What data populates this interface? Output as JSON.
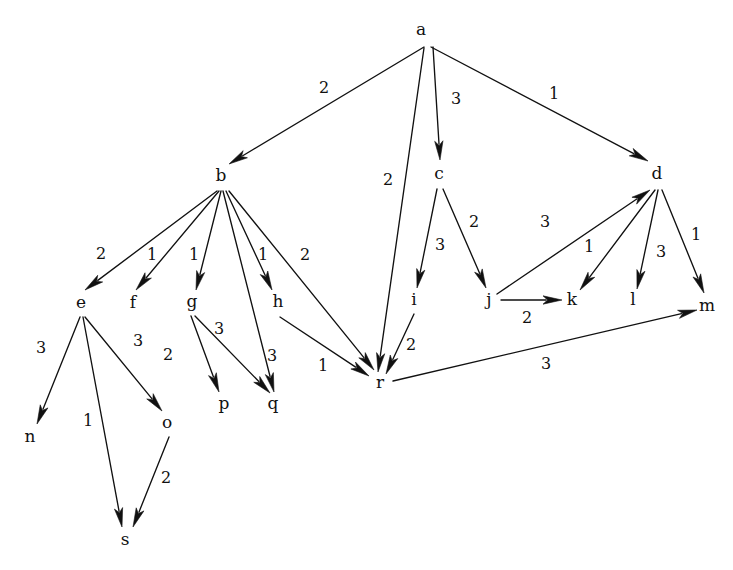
{
  "diagram": {
    "type": "directed-graph",
    "background_color": "#ffffff",
    "ink_color": "#111111",
    "width": 733,
    "height": 570,
    "nodes": [
      {
        "id": "a",
        "label": "a",
        "x": 421,
        "y": 30,
        "anchor_x": 425,
        "anchor_y": 47
      },
      {
        "id": "b",
        "label": "b",
        "x": 221,
        "y": 176,
        "anchor_x": 222,
        "anchor_y": 191
      },
      {
        "id": "c",
        "label": "c",
        "x": 439,
        "y": 174,
        "anchor_x": 440,
        "anchor_y": 189
      },
      {
        "id": "d",
        "label": "d",
        "x": 657,
        "y": 174,
        "anchor_x": 658,
        "anchor_y": 190
      },
      {
        "id": "e",
        "label": "e",
        "x": 81,
        "y": 303,
        "anchor_x": 82,
        "anchor_y": 317
      },
      {
        "id": "f",
        "label": "f",
        "x": 133,
        "y": 303,
        "anchor_x": 133,
        "anchor_y": 317
      },
      {
        "id": "g",
        "label": "g",
        "x": 192,
        "y": 302,
        "anchor_x": 193,
        "anchor_y": 316
      },
      {
        "id": "h",
        "label": "h",
        "x": 278,
        "y": 302,
        "anchor_x": 280,
        "anchor_y": 316
      },
      {
        "id": "i",
        "label": "i",
        "x": 414,
        "y": 300,
        "anchor_x": 414,
        "anchor_y": 314
      },
      {
        "id": "j",
        "label": "j",
        "x": 489,
        "y": 300,
        "anchor_x": 492,
        "anchor_y": 303
      },
      {
        "id": "k",
        "label": "k",
        "x": 572,
        "y": 300,
        "anchor_x": 572,
        "anchor_y": 300
      },
      {
        "id": "l",
        "label": "l",
        "x": 633,
        "y": 300,
        "anchor_x": 633,
        "anchor_y": 300
      },
      {
        "id": "m",
        "label": "m",
        "x": 707,
        "y": 306,
        "anchor_x": 707,
        "anchor_y": 306
      },
      {
        "id": "n",
        "label": "n",
        "x": 30,
        "y": 437,
        "anchor_x": 30,
        "anchor_y": 437
      },
      {
        "id": "o",
        "label": "o",
        "x": 167,
        "y": 423,
        "anchor_x": 170,
        "anchor_y": 436
      },
      {
        "id": "p",
        "label": "p",
        "x": 224,
        "y": 404,
        "anchor_x": 224,
        "anchor_y": 404
      },
      {
        "id": "q",
        "label": "q",
        "x": 273,
        "y": 404,
        "anchor_x": 273,
        "anchor_y": 404
      },
      {
        "id": "r",
        "label": "r",
        "x": 380,
        "y": 383,
        "anchor_x": 386,
        "anchor_y": 381
      },
      {
        "id": "s",
        "label": "s",
        "x": 125,
        "y": 540,
        "anchor_x": 125,
        "anchor_y": 540
      }
    ],
    "edges": [
      {
        "from": "a",
        "to": "b",
        "weight": "2",
        "x1": 424,
        "y1": 47,
        "x2": 229,
        "y2": 164,
        "lx": 324,
        "ly": 88
      },
      {
        "from": "a",
        "to": "c",
        "weight": "3",
        "x1": 433,
        "y1": 47,
        "x2": 440,
        "y2": 160,
        "lx": 456,
        "ly": 99
      },
      {
        "from": "a",
        "to": "d",
        "weight": "1",
        "x1": 431,
        "y1": 47,
        "x2": 648,
        "y2": 161,
        "lx": 554,
        "ly": 94
      },
      {
        "from": "a",
        "to": "r",
        "weight": "2",
        "x1": 424,
        "y1": 48,
        "x2": 378,
        "y2": 372,
        "lx": 388,
        "ly": 180
      },
      {
        "from": "b",
        "to": "e",
        "weight": "2",
        "x1": 217,
        "y1": 191,
        "x2": 85,
        "y2": 290,
        "lx": 101,
        "ly": 254
      },
      {
        "from": "b",
        "to": "f",
        "weight": "1",
        "x1": 219,
        "y1": 191,
        "x2": 136,
        "y2": 290,
        "lx": 152,
        "ly": 255
      },
      {
        "from": "b",
        "to": "g",
        "weight": "1",
        "x1": 221,
        "y1": 191,
        "x2": 196,
        "y2": 290,
        "lx": 194,
        "ly": 255
      },
      {
        "from": "b",
        "to": "h",
        "weight": "1",
        "x1": 226,
        "y1": 191,
        "x2": 272,
        "y2": 290,
        "lx": 263,
        "ly": 255
      },
      {
        "from": "b",
        "to": "q",
        "weight": "3",
        "x1": 223,
        "y1": 191,
        "x2": 274,
        "y2": 392,
        "lx": 272,
        "ly": 356
      },
      {
        "from": "b",
        "to": "r",
        "weight": "2",
        "x1": 229,
        "y1": 191,
        "x2": 374,
        "y2": 370,
        "lx": 305,
        "ly": 255
      },
      {
        "from": "c",
        "to": "i",
        "weight": "3",
        "x1": 437,
        "y1": 189,
        "x2": 417,
        "y2": 288,
        "lx": 440,
        "ly": 245
      },
      {
        "from": "c",
        "to": "j",
        "weight": "2",
        "x1": 443,
        "y1": 189,
        "x2": 486,
        "y2": 288,
        "lx": 474,
        "ly": 222
      },
      {
        "from": "d",
        "to": "k",
        "weight": "1",
        "x1": 655,
        "y1": 190,
        "x2": 580,
        "y2": 290,
        "lx": 589,
        "ly": 247
      },
      {
        "from": "d",
        "to": "l",
        "weight": "3",
        "x1": 658,
        "y1": 190,
        "x2": 637,
        "y2": 289,
        "lx": 661,
        "ly": 252
      },
      {
        "from": "d",
        "to": "m",
        "weight": "1",
        "x1": 662,
        "y1": 190,
        "x2": 704,
        "y2": 293,
        "lx": 696,
        "ly": 235
      },
      {
        "from": "e",
        "to": "n",
        "weight": "3",
        "x1": 80,
        "y1": 317,
        "x2": 37,
        "y2": 424,
        "lx": 41,
        "ly": 348
      },
      {
        "from": "e",
        "to": "s",
        "weight": "1",
        "x1": 83,
        "y1": 317,
        "x2": 122,
        "y2": 527,
        "lx": 88,
        "ly": 421
      },
      {
        "from": "e",
        "to": "o",
        "weight": "3",
        "x1": 85,
        "y1": 317,
        "x2": 162,
        "y2": 411,
        "lx": 138,
        "ly": 341
      },
      {
        "from": "o",
        "to": "s",
        "weight": "2",
        "x1": 169,
        "y1": 437,
        "x2": 133,
        "y2": 527,
        "lx": 166,
        "ly": 478
      },
      {
        "from": "g",
        "to": "p",
        "weight": "2",
        "x1": 191,
        "y1": 316,
        "x2": 219,
        "y2": 392,
        "lx": 168,
        "ly": 355
      },
      {
        "from": "g",
        "to": "q",
        "weight": "3",
        "x1": 195,
        "y1": 316,
        "x2": 270,
        "y2": 393,
        "lx": 219,
        "ly": 329
      },
      {
        "from": "h",
        "to": "r",
        "weight": "1",
        "x1": 280,
        "y1": 317,
        "x2": 369,
        "y2": 376,
        "lx": 323,
        "ly": 366
      },
      {
        "from": "i",
        "to": "r",
        "weight": "2",
        "x1": 414,
        "y1": 314,
        "x2": 386,
        "y2": 374,
        "lx": 411,
        "ly": 345
      },
      {
        "from": "j",
        "to": "d",
        "weight": "3",
        "x1": 497,
        "y1": 294,
        "x2": 650,
        "y2": 190,
        "lx": 545,
        "ly": 222
      },
      {
        "from": "j",
        "to": "k",
        "weight": "2",
        "x1": 501,
        "y1": 300,
        "x2": 562,
        "y2": 300,
        "lx": 527,
        "ly": 318
      },
      {
        "from": "r",
        "to": "m",
        "weight": "3",
        "x1": 393,
        "y1": 381,
        "x2": 697,
        "y2": 310,
        "lx": 546,
        "ly": 364
      }
    ]
  }
}
